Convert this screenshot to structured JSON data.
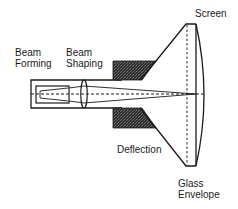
{
  "diagram": {
    "labels": {
      "beam_forming_line1": "Beam",
      "beam_forming_line2": "Forming",
      "beam_shaping_line1": "Beam",
      "beam_shaping_line2": "Shaping",
      "screen": "Screen",
      "deflection": "Deflection",
      "glass_envelope_line1": "Glass",
      "glass_envelope_line2": "Envelope"
    },
    "colors": {
      "line": "#1a1a1a",
      "yoke_fill": "#3a3a3a",
      "background": "#ffffff"
    }
  }
}
